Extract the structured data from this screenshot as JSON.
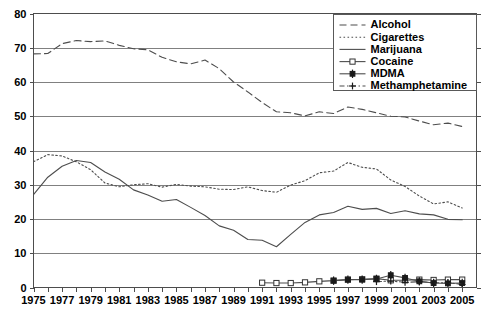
{
  "chart_data": {
    "type": "line",
    "title": "",
    "subtitle": "",
    "xlabel": "",
    "ylabel": "",
    "xlim": [
      1975,
      2006
    ],
    "ylim": [
      0,
      80
    ],
    "y_ticks": [
      0,
      10,
      20,
      30,
      40,
      50,
      60,
      70,
      80
    ],
    "x_ticks": [
      1975,
      1976,
      1977,
      1978,
      1979,
      1980,
      1981,
      1982,
      1983,
      1984,
      1985,
      1986,
      1987,
      1988,
      1989,
      1990,
      1991,
      1992,
      1993,
      1994,
      1995,
      1996,
      1997,
      1998,
      1999,
      2000,
      2001,
      2002,
      2003,
      2004,
      2005
    ],
    "x_tick_labels": [
      "1975",
      "",
      "1977",
      "",
      "1979",
      "",
      "1981",
      "",
      "1983",
      "",
      "1985",
      "",
      "1987",
      "",
      "1989",
      "",
      "1991",
      "",
      "1993",
      "",
      "1995",
      "",
      "1997",
      "",
      "1999",
      "",
      "2001",
      "",
      "2003",
      "",
      "2005"
    ],
    "y_tick_labels": [
      "0",
      "10",
      "20",
      "30",
      "40",
      "50",
      "60",
      "70",
      "80"
    ],
    "grid": true,
    "grid_axis": "y",
    "legend_position": "top-right",
    "series": [
      {
        "name": "Alcohol",
        "style": "dashed",
        "marker": "none",
        "x": [
          1975,
          1976,
          1977,
          1978,
          1979,
          1980,
          1981,
          1982,
          1983,
          1984,
          1985,
          1986,
          1987,
          1988,
          1989,
          1990,
          1991,
          1992,
          1993,
          1994,
          1995,
          1996,
          1997,
          1998,
          1999,
          2000,
          2001,
          2002,
          2003,
          2004,
          2005
        ],
        "values": [
          68.2,
          68.3,
          71.2,
          72.1,
          71.8,
          72.0,
          70.7,
          69.7,
          69.4,
          67.2,
          65.9,
          65.3,
          66.4,
          63.9,
          60.0,
          57.1,
          54.0,
          51.3,
          51.0,
          50.1,
          51.3,
          50.8,
          52.7,
          52.0,
          51.0,
          50.0,
          49.8,
          48.6,
          47.5,
          48.0,
          47.0
        ]
      },
      {
        "name": "Cigarettes",
        "style": "dotted",
        "marker": "none",
        "x": [
          1975,
          1976,
          1977,
          1978,
          1979,
          1980,
          1981,
          1982,
          1983,
          1984,
          1985,
          1986,
          1987,
          1988,
          1989,
          1990,
          1991,
          1992,
          1993,
          1994,
          1995,
          1996,
          1997,
          1998,
          1999,
          2000,
          2001,
          2002,
          2003,
          2004,
          2005
        ],
        "values": [
          36.7,
          38.8,
          38.4,
          36.7,
          34.4,
          30.5,
          29.4,
          30.0,
          30.3,
          29.3,
          30.1,
          29.6,
          29.4,
          28.7,
          28.6,
          29.4,
          28.3,
          27.8,
          29.9,
          31.2,
          33.5,
          34.0,
          36.5,
          35.1,
          34.6,
          31.4,
          29.5,
          26.7,
          24.4,
          25.0,
          23.2
        ]
      },
      {
        "name": "Marijuana",
        "style": "solid",
        "marker": "none",
        "x": [
          1975,
          1976,
          1977,
          1978,
          1979,
          1980,
          1981,
          1982,
          1983,
          1984,
          1985,
          1986,
          1987,
          1988,
          1989,
          1990,
          1991,
          1992,
          1993,
          1994,
          1995,
          1996,
          1997,
          1998,
          1999,
          2000,
          2001,
          2002,
          2003,
          2004,
          2005
        ],
        "values": [
          27.1,
          32.2,
          35.4,
          37.1,
          36.5,
          33.7,
          31.6,
          28.5,
          27.0,
          25.2,
          25.7,
          23.4,
          21.0,
          18.0,
          16.7,
          14.0,
          13.8,
          11.9,
          15.5,
          19.0,
          21.2,
          21.9,
          23.7,
          22.8,
          23.1,
          21.6,
          22.4,
          21.5,
          21.2,
          19.9,
          19.8
        ]
      },
      {
        "name": "Cocaine",
        "style": "solid",
        "marker": "open-square",
        "x": [
          1991,
          1992,
          1993,
          1994,
          1995,
          1996,
          1997,
          1998,
          1999,
          2000,
          2001,
          2002,
          2003,
          2004,
          2005
        ],
        "values": [
          1.4,
          1.3,
          1.3,
          1.5,
          1.8,
          2.0,
          2.3,
          2.4,
          2.6,
          2.1,
          2.1,
          2.3,
          2.2,
          2.3,
          2.3
        ]
      },
      {
        "name": "MDMA",
        "style": "solid",
        "marker": "filled-plus",
        "x": [
          1996,
          1997,
          1998,
          1999,
          2000,
          2001,
          2002,
          2003,
          2004,
          2005
        ],
        "values": [
          2.0,
          2.3,
          2.3,
          2.5,
          3.6,
          2.8,
          1.8,
          1.3,
          1.2,
          1.3
        ]
      },
      {
        "name": "Methamphetamine",
        "style": "dash-dot",
        "marker": "plus",
        "x": [
          1999,
          2000,
          2001,
          2002,
          2003,
          2004,
          2005
        ],
        "values": [
          1.7,
          1.9,
          1.5,
          1.7,
          1.4,
          1.4,
          0.9
        ]
      }
    ]
  },
  "legend": {
    "items": [
      {
        "label": "Alcohol",
        "style": "dashed",
        "marker": "none"
      },
      {
        "label": "Cigarettes",
        "style": "dotted",
        "marker": "none"
      },
      {
        "label": "Marijuana",
        "style": "solid",
        "marker": "none"
      },
      {
        "label": "Cocaine",
        "style": "solid",
        "marker": "open-square"
      },
      {
        "label": "MDMA",
        "style": "solid",
        "marker": "filled-plus"
      },
      {
        "label": "Methamphetamine",
        "style": "dash-dot",
        "marker": "plus"
      }
    ]
  },
  "colors": {
    "line": "#4d4d4d",
    "grid": "#808080",
    "frame": "#4d4d4d",
    "text": "#000000",
    "background": "#ffffff"
  }
}
